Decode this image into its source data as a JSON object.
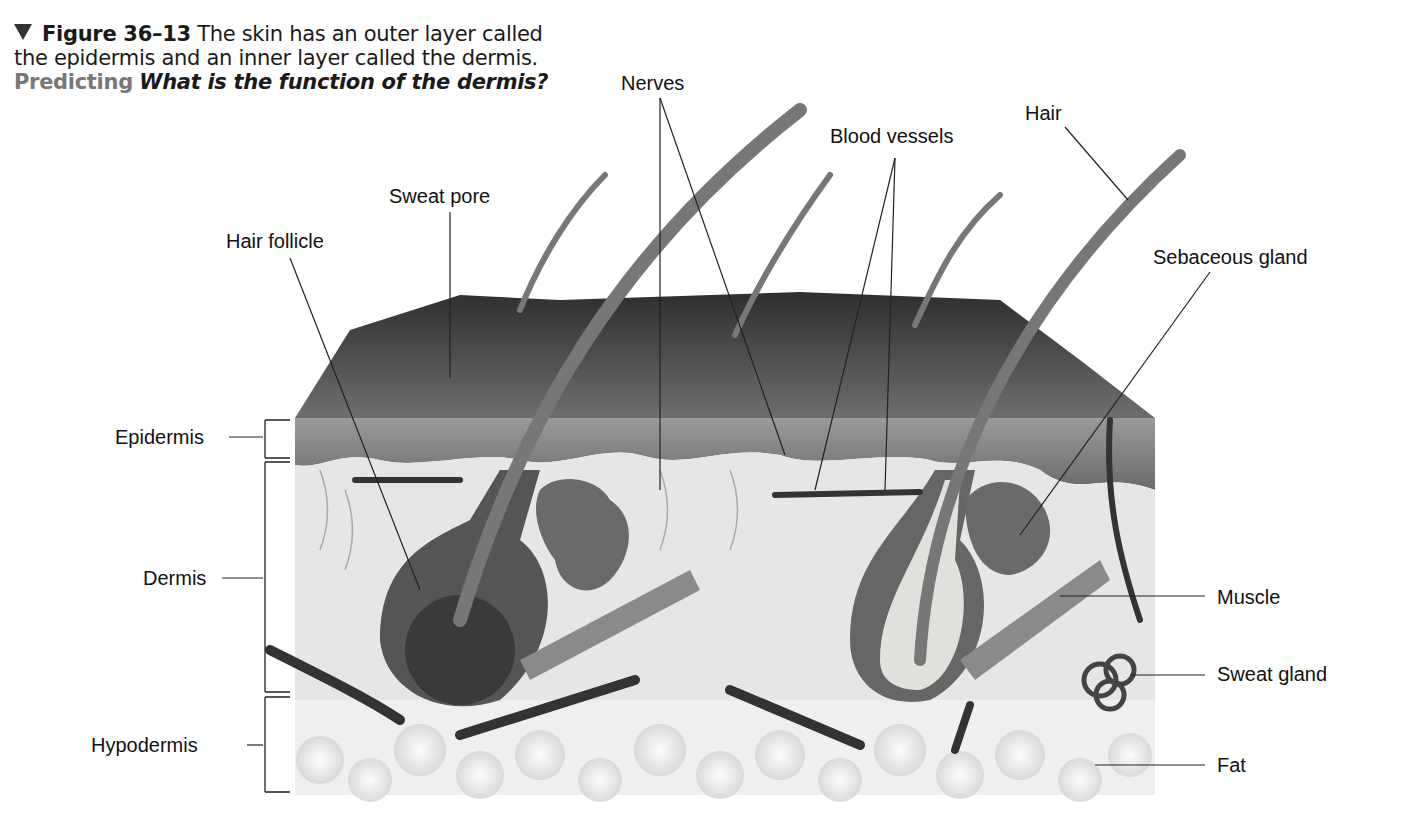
{
  "caption": {
    "figure_number": "Figure 36–13",
    "text": "The skin has an outer layer called the epidermis and an inner layer called the dermis.",
    "skill": "Predicting",
    "question": "What is the function of the dermis?"
  },
  "labels": {
    "nerves": "Nerves",
    "blood_vessels": "Blood vessels",
    "hair": "Hair",
    "sweat_pore": "Sweat pore",
    "hair_follicle": "Hair follicle",
    "sebaceous_gland": "Sebaceous gland",
    "epidermis": "Epidermis",
    "dermis": "Dermis",
    "hypodermis": "Hypodermis",
    "muscle": "Muscle",
    "sweat_gland": "Sweat gland",
    "fat": "Fat"
  },
  "colors": {
    "surface": "#4a4a4a",
    "epidermis": "#8a8a8a",
    "dermis": "#e4e4e2",
    "hypodermis": "#f0f0ee",
    "hair": "#6a6a6a",
    "line": "#222222"
  }
}
